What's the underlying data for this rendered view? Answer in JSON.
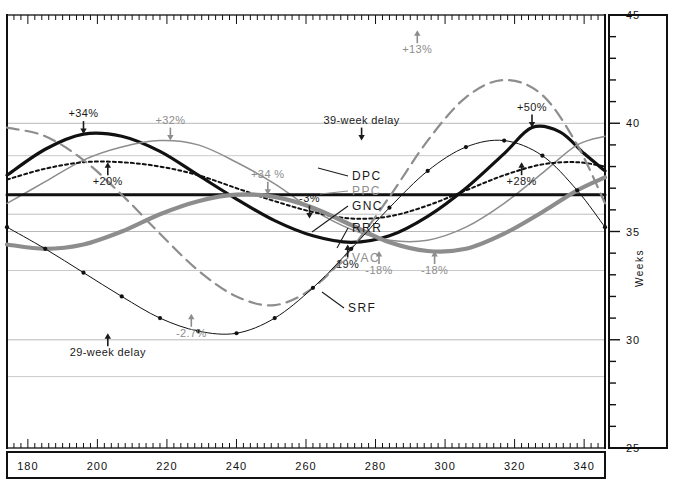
{
  "chart_data": {
    "type": "line",
    "title": "",
    "xlabel": "",
    "ylabel": "Weeks",
    "xlim": [
      174,
      346
    ],
    "ylim": [
      25,
      45
    ],
    "xticks": [
      180,
      200,
      220,
      240,
      260,
      280,
      300,
      320,
      340
    ],
    "yticks": [
      25,
      30,
      35,
      40,
      45
    ],
    "grid": true,
    "legend_position": "inline-callouts",
    "baseline_value": 36.7,
    "series": [
      {
        "name": "DPC",
        "style": "solid-thick",
        "color": "#111111",
        "x": [
          174,
          185,
          196,
          207,
          218,
          229,
          240,
          251,
          262,
          273,
          284,
          295,
          306,
          317,
          325,
          333,
          340,
          346
        ],
        "values": [
          37.6,
          38.8,
          39.5,
          39.4,
          38.7,
          37.6,
          36.5,
          35.5,
          34.8,
          34.5,
          34.8,
          35.7,
          37.0,
          38.6,
          39.8,
          39.6,
          38.6,
          37.8
        ]
      },
      {
        "name": "PPC",
        "style": "solid-thin",
        "color": "#8d8d8d",
        "x": [
          174,
          185,
          196,
          207,
          218,
          229,
          240,
          251,
          262,
          273,
          284,
          295,
          306,
          317,
          328,
          338,
          346
        ],
        "values": [
          36.3,
          37.3,
          38.3,
          38.9,
          39.2,
          39.0,
          38.2,
          37.2,
          36.0,
          35.1,
          34.6,
          34.6,
          35.2,
          36.3,
          37.7,
          39.0,
          39.4
        ]
      },
      {
        "name": "GNC",
        "style": "solid-baseline",
        "color": "#111111",
        "x": [
          174,
          346
        ],
        "values": [
          36.7,
          36.7
        ]
      },
      {
        "name": "RRR",
        "style": "dotted",
        "color": "#111111",
        "x": [
          174,
          185,
          196,
          207,
          218,
          229,
          240,
          251,
          262,
          273,
          284,
          295,
          306,
          317,
          328,
          338,
          346
        ],
        "values": [
          37.4,
          37.9,
          38.2,
          38.2,
          38.0,
          37.6,
          37.0,
          36.4,
          35.9,
          35.6,
          35.7,
          36.2,
          36.9,
          37.6,
          38.1,
          38.2,
          38.0
        ]
      },
      {
        "name": "VAC",
        "style": "solid-thick-gray",
        "color": "#8d8d8d",
        "x": [
          174,
          185,
          196,
          207,
          218,
          229,
          240,
          251,
          262,
          273,
          284,
          295,
          306,
          317,
          328,
          338,
          346
        ],
        "values": [
          34.4,
          34.2,
          34.4,
          35.0,
          35.8,
          36.4,
          36.7,
          36.6,
          36.1,
          35.3,
          34.5,
          34.1,
          34.2,
          34.9,
          35.9,
          36.9,
          37.5
        ]
      },
      {
        "name": "SRF",
        "style": "dash-dot-gray",
        "color": "#8d8d8d",
        "x": [
          174,
          185,
          196,
          207,
          218,
          229,
          240,
          251,
          262,
          273,
          284,
          295,
          306,
          317,
          328,
          338,
          346
        ],
        "values": [
          39.8,
          39.4,
          38.3,
          36.7,
          34.9,
          33.2,
          32.0,
          31.6,
          32.4,
          34.2,
          36.6,
          39.2,
          41.2,
          42.0,
          41.3,
          39.0,
          36.3
        ]
      },
      {
        "name": "39-week delay",
        "style": "marker-line",
        "color": "#111111",
        "x": [
          174,
          185,
          196,
          207,
          218,
          229,
          240,
          251,
          262,
          273,
          284,
          295,
          306,
          317,
          328,
          338,
          346
        ],
        "values": [
          35.2,
          34.2,
          33.1,
          32.0,
          31.0,
          30.4,
          30.3,
          31.0,
          32.4,
          34.2,
          36.1,
          37.8,
          38.9,
          39.2,
          38.5,
          36.9,
          35.2
        ]
      }
    ],
    "annotations": [
      {
        "id": "a-plus34",
        "text": "+34%",
        "x": 196,
        "y": 39.5,
        "color": "dark",
        "arrow": "down"
      },
      {
        "id": "a-plus32",
        "text": "+32%",
        "x": 221,
        "y": 39.2,
        "color": "gray",
        "arrow": "down"
      },
      {
        "id": "a-plus20",
        "text": "+20%",
        "x": 203,
        "y": 38.2,
        "color": "dark",
        "arrow": "up"
      },
      {
        "id": "a-plus34b",
        "text": "+34 %",
        "x": 249,
        "y": 36.7,
        "color": "gray",
        "arrow": "down"
      },
      {
        "id": "a-minus27",
        "text": "-2.7%",
        "x": 227,
        "y": 31.2,
        "color": "gray",
        "arrow": "up"
      },
      {
        "id": "a-29wk",
        "text": "29-week delay",
        "x": 203,
        "y": 30.3,
        "color": "dark",
        "arrow": "up"
      },
      {
        "id": "a-plus13",
        "text": "+13%",
        "x": 292,
        "y": 44.3,
        "color": "gray",
        "arrow": "up"
      },
      {
        "id": "a-39wk",
        "text": "39-week delay",
        "x": 276,
        "y": 39.2,
        "color": "dark",
        "arrow": "down"
      },
      {
        "id": "a-minus3",
        "text": "-3%",
        "x": 261,
        "y": 35.6,
        "color": "dark",
        "arrow": "down"
      },
      {
        "id": "a-19",
        "text": "19%",
        "x": 272,
        "y": 34.4,
        "color": "dark",
        "arrow": "up"
      },
      {
        "id": "a-minus18",
        "text": "-18%",
        "x": 281,
        "y": 34.1,
        "color": "gray",
        "arrow": "up"
      },
      {
        "id": "a-minus18b",
        "text": "-18%",
        "x": 297,
        "y": 34.1,
        "color": "gray",
        "arrow": "up"
      },
      {
        "id": "a-plus50",
        "text": "+50%",
        "x": 325,
        "y": 39.8,
        "color": "dark",
        "arrow": "down"
      },
      {
        "id": "a-plus28",
        "text": "+28%",
        "x": 322,
        "y": 38.2,
        "color": "dark",
        "arrow": "up"
      }
    ],
    "callouts": [
      {
        "id": "c-dpc",
        "label": "DPC",
        "color": "dark",
        "lx": 352,
        "ly": 180,
        "tx": 318,
        "ty": 168
      },
      {
        "id": "c-ppc",
        "label": "PPC",
        "color": "gray",
        "lx": 352,
        "ly": 195,
        "tx": 320,
        "ty": 194
      },
      {
        "id": "c-gnc",
        "label": "GNC",
        "color": "dark",
        "lx": 352,
        "ly": 210,
        "tx": 312,
        "ty": 232
      },
      {
        "id": "c-rrr",
        "label": "RRR",
        "color": "dark",
        "lx": 352,
        "ly": 232,
        "tx": 337,
        "ty": 248
      },
      {
        "id": "c-vac",
        "label": "VAC",
        "color": "gray",
        "lx": 352,
        "ly": 262,
        "tx": 325,
        "ty": 276
      },
      {
        "id": "c-srf",
        "label": "SRF",
        "color": "dark",
        "lx": 348,
        "ly": 312,
        "tx": 322,
        "ty": 292
      }
    ]
  },
  "axes": {
    "right_axis_title": "Weeks",
    "y_tick_labels": [
      "45",
      "40",
      "35",
      "30",
      "25"
    ],
    "x_tick_labels": [
      "180",
      "200",
      "220",
      "240",
      "260",
      "280",
      "300",
      "320",
      "340"
    ]
  }
}
